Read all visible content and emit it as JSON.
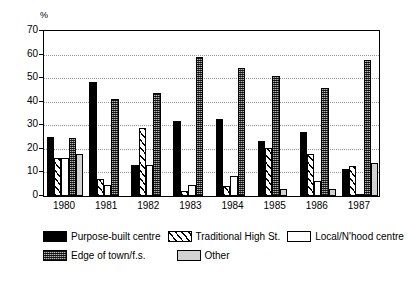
{
  "chart_data": {
    "type": "bar",
    "title": "",
    "subtitle": "",
    "xlabel": "",
    "ylabel": "%",
    "ylim": [
      0,
      70
    ],
    "ytick_step": 10,
    "yticks": [
      70,
      60,
      50,
      40,
      30,
      20,
      10,
      0
    ],
    "grid": true,
    "legend_position": "bottom",
    "categories": [
      "1980",
      "1981",
      "1982",
      "1983",
      "1984",
      "1985",
      "1986",
      "1987"
    ],
    "series": [
      {
        "name": "Purpose-built centre",
        "pattern": "solid-black",
        "color": "#000000",
        "values": [
          25.0,
          48.3,
          13.0,
          31.8,
          32.8,
          23.5,
          27.0,
          11.5
        ]
      },
      {
        "name": "Traditional High St.",
        "pattern": "diagonal-hatch",
        "color": "#ffffff",
        "values": [
          16.2,
          7.3,
          28.8,
          2.0,
          4.3,
          20.5,
          17.8,
          12.6
        ]
      },
      {
        "name": "Local/N'hood centre",
        "pattern": "white",
        "color": "#ffffff",
        "values": [
          16.2,
          4.5,
          13.0,
          4.8,
          8.6,
          null,
          6.5,
          1.0
        ]
      },
      {
        "name": "Edge of town/f.s.",
        "pattern": "checkered-dark",
        "color": "#5a5a5a",
        "values": [
          24.7,
          41.2,
          43.5,
          58.8,
          54.3,
          51.0,
          45.7,
          57.5
        ]
      },
      {
        "name": "Other",
        "pattern": "light-grey",
        "color": "#d2d2d2",
        "values": [
          18.0,
          null,
          null,
          null,
          null,
          3.0,
          2.8,
          14.2
        ]
      }
    ]
  },
  "axis": {
    "unit_label": "%"
  },
  "legend": {
    "items": [
      {
        "label": "Purpose-built centre",
        "swatch": "solid-black"
      },
      {
        "label": "Traditional High St.",
        "swatch": "diagonal-hatch"
      },
      {
        "label": "Local/N'hood centre",
        "swatch": "white"
      },
      {
        "label": "Edge of town/f.s.",
        "swatch": "checkered-dark"
      },
      {
        "label": "Other",
        "swatch": "light-grey"
      }
    ]
  }
}
